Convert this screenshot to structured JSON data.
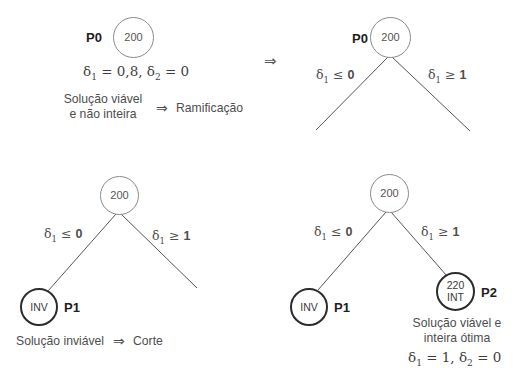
{
  "figure": {
    "type": "branch-and-bound-tree-diagram",
    "background": "#ffffff",
    "line_color": "#555555",
    "thick_node_border": "#2b2b2b"
  },
  "transition_arrow": "⇒",
  "panels": {
    "top_left": {
      "name": "panel-initial-relaxation",
      "root": {
        "label": "P0",
        "value": "200"
      },
      "equation": {
        "d1": "δ",
        "sub1": "1",
        "eq1": "= 0,8,",
        "d2": "δ",
        "sub2": "2",
        "eq2": "= 0"
      },
      "caption_line1": "Solução viável",
      "caption_line2": "e não inteira",
      "caption_arrow": "⇒",
      "caption_result": "Ramificação"
    },
    "top_right": {
      "name": "panel-branching",
      "root": {
        "label": "P0",
        "value": "200"
      },
      "edge_left": {
        "d": "δ",
        "sub": "1",
        "rel": "≤",
        "val": "0"
      },
      "edge_right": {
        "d": "δ",
        "sub": "1",
        "rel": "≥",
        "val": "1"
      }
    },
    "bottom_left": {
      "name": "panel-left-branch-infeasible",
      "root": {
        "value": "200"
      },
      "edge_left": {
        "d": "δ",
        "sub": "1",
        "rel": "≤",
        "val": "0"
      },
      "edge_right": {
        "d": "δ",
        "sub": "1",
        "rel": "≥",
        "val": "1"
      },
      "child_left": {
        "value": "INV",
        "label": "P1"
      },
      "caption": "Solução inviável",
      "caption_arrow": "⇒",
      "caption_result": "Corte"
    },
    "bottom_right": {
      "name": "panel-right-branch-optimal",
      "root": {
        "value": "200"
      },
      "edge_left": {
        "d": "δ",
        "sub": "1",
        "rel": "≤",
        "val": "0"
      },
      "edge_right": {
        "d": "δ",
        "sub": "1",
        "rel": "≥",
        "val": "1"
      },
      "child_left": {
        "value": "INV",
        "label": "P1"
      },
      "child_right": {
        "value_top": "220",
        "value_bottom": "INT",
        "label": "P2"
      },
      "caption_line1": "Solução viável e",
      "caption_line2": "inteira ótima",
      "equation": {
        "d1": "δ",
        "sub1": "1",
        "eq1": "= 1,",
        "d2": "δ",
        "sub2": "2",
        "eq2": "= 0"
      }
    }
  }
}
